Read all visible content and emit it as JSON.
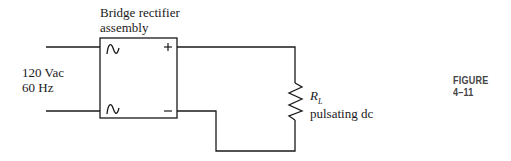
{
  "diagram": {
    "bridge_label": [
      "Bridge rectifier",
      "assembly"
    ],
    "source_label": [
      "120 Vac",
      "60 Hz"
    ],
    "plus_sign": "+",
    "minus_sign": "–",
    "ac_symbol": "~",
    "load_label": "R",
    "load_subscript": "L",
    "load_desc": "pulsating dc",
    "figure_label": "FIGURE 4–11",
    "line_color": "#1a1a1a"
  }
}
